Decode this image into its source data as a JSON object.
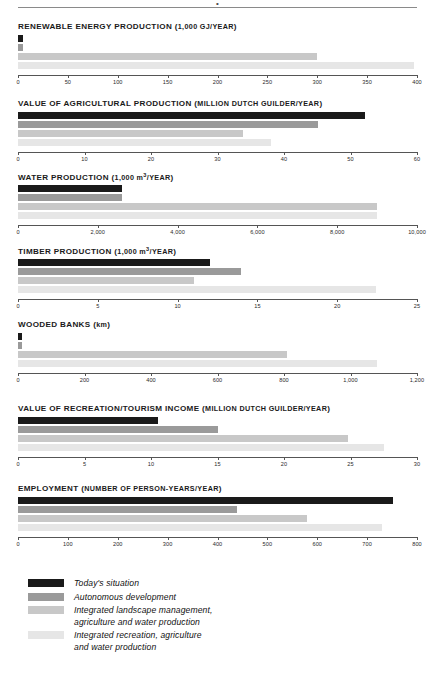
{
  "header": {
    "rule_mark": "•"
  },
  "legend": {
    "items": [
      {
        "label": "Today's situation",
        "color": "#1a1a1a"
      },
      {
        "label": "Autonomous development",
        "color": "#9a9a9a"
      },
      {
        "label": "Integrated landscape management,\nagriculture and water production",
        "color": "#c8c8c8"
      },
      {
        "label": "Integrated recreation, agriculture\nand water production",
        "color": "#e6e6e6"
      }
    ]
  },
  "chart_data": [
    {
      "type": "bar",
      "orientation": "horizontal",
      "title": "RENEWABLE ENERGY PRODUCTION (1,000 GJ/YEAR)",
      "categories": [
        "Today's situation",
        "Autonomous development",
        "Integrated landscape management, agriculture and water production",
        "Integrated recreation, agriculture and water production"
      ],
      "values": [
        5,
        5,
        300,
        397
      ],
      "colors": [
        "#1a1a1a",
        "#9a9a9a",
        "#c8c8c8",
        "#e6e6e6"
      ],
      "xlim": [
        0,
        400
      ],
      "xticks": [
        0,
        50,
        100,
        150,
        200,
        250,
        300,
        350,
        400
      ],
      "xticklabels": [
        "0",
        "50",
        "100",
        "150",
        "200",
        "250",
        "300",
        "350",
        "400"
      ],
      "xlabel": "",
      "ylabel": "",
      "grid": false
    },
    {
      "type": "bar",
      "orientation": "horizontal",
      "title": "VALUE OF AGRICULTURAL PRODUCTION (MILLION DUTCH GUILDER/YEAR)",
      "categories": [
        "Today's situation",
        "Autonomous development",
        "Integrated landscape management, agriculture and water production",
        "Integrated recreation, agriculture and water production"
      ],
      "values": [
        52.2,
        45.1,
        33.8,
        38.0
      ],
      "colors": [
        "#1a1a1a",
        "#9a9a9a",
        "#c8c8c8",
        "#e6e6e6"
      ],
      "xlim": [
        0,
        60
      ],
      "xticks": [
        0,
        10,
        20,
        30,
        40,
        50,
        60
      ],
      "xticklabels": [
        "0",
        "10",
        "20",
        "30",
        "40",
        "50",
        "60"
      ],
      "xlabel": "",
      "ylabel": "",
      "grid": false
    },
    {
      "type": "bar",
      "orientation": "horizontal",
      "title": "WATER PRODUCTION (1,000 m3/YEAR)",
      "categories": [
        "Today's situation",
        "Autonomous development",
        "Integrated landscape management, agriculture and water production",
        "Integrated recreation, agriculture and water production"
      ],
      "values": [
        2600,
        2600,
        9000,
        9000
      ],
      "colors": [
        "#1a1a1a",
        "#9a9a9a",
        "#c8c8c8",
        "#e6e6e6"
      ],
      "xlim": [
        0,
        10000
      ],
      "xticks": [
        0,
        2000,
        4000,
        6000,
        8000,
        10000
      ],
      "xticklabels": [
        "0",
        "2,000",
        "4,000",
        "6,000",
        "8,000",
        "10,000"
      ],
      "xlabel": "",
      "ylabel": "",
      "grid": false
    },
    {
      "type": "bar",
      "orientation": "horizontal",
      "title": "TIMBER PRODUCTION (1,000 m3/YEAR)",
      "categories": [
        "Today's situation",
        "Autonomous development",
        "Integrated landscape management, agriculture and water production",
        "Integrated recreation, agriculture and water production"
      ],
      "values": [
        12.0,
        14.0,
        11.0,
        22.4
      ],
      "colors": [
        "#1a1a1a",
        "#9a9a9a",
        "#c8c8c8",
        "#e6e6e6"
      ],
      "xlim": [
        0,
        25
      ],
      "xticks": [
        0,
        5,
        10,
        15,
        20,
        25
      ],
      "xticklabels": [
        "0",
        "5",
        "10",
        "15",
        "20",
        "25"
      ],
      "xlabel": "",
      "ylabel": "",
      "grid": false
    },
    {
      "type": "bar",
      "orientation": "horizontal",
      "title": "WOODED BANKS (km)",
      "categories": [
        "Today's situation",
        "Autonomous development",
        "Integrated landscape management, agriculture and water production",
        "Integrated recreation, agriculture and water production"
      ],
      "values": [
        12,
        12,
        810,
        1080
      ],
      "colors": [
        "#1a1a1a",
        "#9a9a9a",
        "#c8c8c8",
        "#e6e6e6"
      ],
      "xlim": [
        0,
        1200
      ],
      "xticks": [
        0,
        200,
        400,
        600,
        800,
        1000,
        1200
      ],
      "xticklabels": [
        "0",
        "200",
        "400",
        "600",
        "800",
        "1,000",
        "1,200"
      ],
      "xlabel": "",
      "ylabel": "",
      "grid": false
    },
    {
      "type": "bar",
      "orientation": "horizontal",
      "title": "VALUE OF RECREATION/TOURISM INCOME (MILLION DUTCH GUILDER/YEAR)",
      "categories": [
        "Today's situation",
        "Autonomous development",
        "Integrated landscape management, agriculture and water production",
        "Integrated recreation, agriculture and water production"
      ],
      "values": [
        10.5,
        15.0,
        24.8,
        27.5
      ],
      "colors": [
        "#1a1a1a",
        "#9a9a9a",
        "#c8c8c8",
        "#e6e6e6"
      ],
      "xlim": [
        0,
        30
      ],
      "xticks": [
        0,
        5,
        10,
        15,
        20,
        25,
        30
      ],
      "xticklabels": [
        "0",
        "5",
        "10",
        "15",
        "20",
        "25",
        "30"
      ],
      "xlabel": "",
      "ylabel": "",
      "grid": false
    },
    {
      "type": "bar",
      "orientation": "horizontal",
      "title": "EMPLOYMENT (NUMBER OF PERSON-YEARS/YEAR)",
      "categories": [
        "Today's situation",
        "Autonomous development",
        "Integrated landscape management, agriculture and water production",
        "Integrated recreation, agriculture and water production"
      ],
      "values": [
        752,
        440,
        580,
        730
      ],
      "colors": [
        "#1a1a1a",
        "#9a9a9a",
        "#c8c8c8",
        "#e6e6e6"
      ],
      "xlim": [
        0,
        800
      ],
      "xticks": [
        0,
        100,
        200,
        300,
        400,
        500,
        600,
        700,
        800
      ],
      "xticklabels": [
        "0",
        "100",
        "200",
        "300",
        "400",
        "500",
        "600",
        "700",
        "800"
      ],
      "xlabel": "",
      "ylabel": "",
      "grid": false
    }
  ]
}
